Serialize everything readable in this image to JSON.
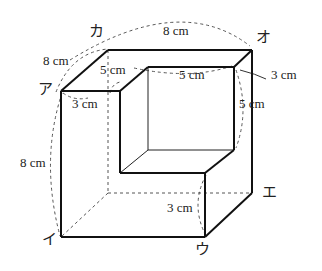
{
  "figure": {
    "type": "solid-with-cube-removed",
    "vertices": {
      "a": "ア",
      "i": "イ",
      "u": "ウ",
      "e": "エ",
      "o": "オ",
      "ka": "カ"
    },
    "dimensions": {
      "top_back_edge": "8 cm",
      "top_left_edge": "8 cm",
      "left_height": "8 cm",
      "notch_depth_left": "5 cm",
      "notch_width_top": "5 cm",
      "front_slab_thickness": "3 cm",
      "right_slab_thickness": "3 cm",
      "notch_height_right": "5 cm",
      "bottom_slab_height": "3 cm"
    }
  }
}
